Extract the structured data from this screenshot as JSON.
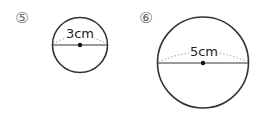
{
  "problems": [
    {
      "number_label": "⑤",
      "diameter_label": "3cm",
      "circle": {
        "cx": 80,
        "cy": 45,
        "r": 27.5
      },
      "number_pos": {
        "x": 22,
        "y": 23
      }
    },
    {
      "number_label": "⑥",
      "diameter_label": "5cm",
      "circle": {
        "cx": 203,
        "cy": 62.5,
        "r": 45.5
      },
      "number_pos": {
        "x": 146,
        "y": 23
      }
    }
  ],
  "colors": {
    "stroke": "#333333",
    "dotted": "#aaaaaa",
    "number": "#777777"
  }
}
